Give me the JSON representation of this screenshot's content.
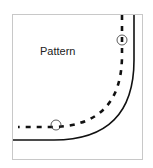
{
  "diagram": {
    "label": "Pattern",
    "colors": {
      "frame": "#c8c8c8",
      "line": "#111111",
      "background": "#ffffff"
    },
    "elements": [
      {
        "type": "solid-curve",
        "description": "rounded corner outline"
      },
      {
        "type": "dashed-curve",
        "description": "pattern seam line"
      },
      {
        "type": "circled-dash",
        "position": "top-right"
      },
      {
        "type": "circled-dash",
        "position": "bottom-left"
      }
    ]
  }
}
